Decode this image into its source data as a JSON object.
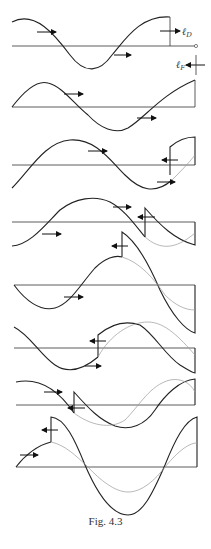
{
  "figure": {
    "caption": "Fig. 4.3",
    "labels": {
      "incident_field": {
        "symbol": "ℓ",
        "subscript": "D"
      },
      "reflected_field": {
        "symbol": "ℓ",
        "subscript": "F"
      }
    },
    "panel_count": 8
  }
}
